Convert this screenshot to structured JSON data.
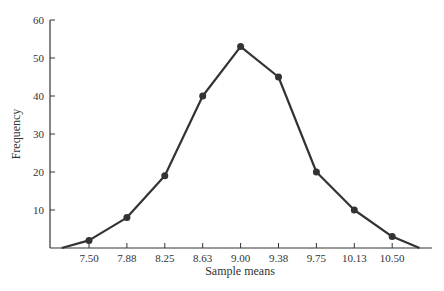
{
  "chart_data": {
    "type": "line",
    "title": "",
    "xlabel": "Sample means",
    "ylabel": "Frequency",
    "categories": [
      "7.50",
      "7.88",
      "8.25",
      "8.63",
      "9.00",
      "9.38",
      "9.75",
      "10.13",
      "10.50"
    ],
    "values": [
      2,
      8,
      19,
      40,
      53,
      45,
      20,
      10,
      3
    ],
    "line_endpoints": {
      "start": {
        "x": 7.13,
        "y": 0
      },
      "end": {
        "x": 10.87,
        "y": 0
      }
    },
    "yticks": [
      10,
      20,
      30,
      40,
      50,
      60
    ],
    "ylim": [
      0,
      60
    ],
    "grid": false,
    "legend": null,
    "series": [
      {
        "name": "Frequency",
        "values": [
          2,
          8,
          19,
          40,
          53,
          45,
          20,
          10,
          3
        ],
        "color": "#333333",
        "markers": true
      }
    ]
  }
}
